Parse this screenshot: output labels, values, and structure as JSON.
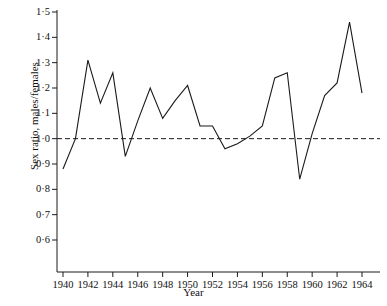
{
  "chart_data": {
    "type": "line",
    "title": "",
    "xlabel": "Year",
    "ylabel": "Sex ratio, males/females",
    "xlim": [
      1939.0,
      1965.0
    ],
    "ylim": [
      0.55,
      1.52
    ],
    "grid": false,
    "legend": null,
    "decimal_separator": "·",
    "y_ticks": [
      {
        "value": 1.5,
        "label": "1·5"
      },
      {
        "value": 1.4,
        "label": "1·4"
      },
      {
        "value": 1.3,
        "label": "1·3"
      },
      {
        "value": 1.2,
        "label": "1·2"
      },
      {
        "value": 1.1,
        "label": "1·1"
      },
      {
        "value": 1.0,
        "label": "1·0"
      },
      {
        "value": 0.9,
        "label": "0·9"
      },
      {
        "value": 0.8,
        "label": "0·8"
      },
      {
        "value": 0.7,
        "label": "0·7"
      },
      {
        "value": 0.6,
        "label": "0·6"
      }
    ],
    "x_ticks": [
      {
        "value": 1940,
        "label": "1940"
      },
      {
        "value": 1942,
        "label": "1942"
      },
      {
        "value": 1944,
        "label": "1944"
      },
      {
        "value": 1946,
        "label": "1946"
      },
      {
        "value": 1948,
        "label": "1948"
      },
      {
        "value": 1950,
        "label": "1950"
      },
      {
        "value": 1952,
        "label": "1952"
      },
      {
        "value": 1954,
        "label": "1954"
      },
      {
        "value": 1956,
        "label": "1956"
      },
      {
        "value": 1958,
        "label": "1958"
      },
      {
        "value": 1960,
        "label": "1960"
      },
      {
        "value": 1962,
        "label": "1962"
      },
      {
        "value": 1964,
        "label": "1964"
      }
    ],
    "x": [
      1940,
      1941,
      1942,
      1943,
      1944,
      1945,
      1946,
      1947,
      1948,
      1949,
      1950,
      1951,
      1952,
      1953,
      1954,
      1955,
      1956,
      1957,
      1958,
      1959,
      1960,
      1961,
      1962,
      1963,
      1964
    ],
    "values": [
      0.88,
      1.0,
      1.31,
      1.14,
      1.26,
      0.93,
      1.07,
      1.2,
      1.08,
      1.15,
      1.21,
      1.05,
      1.05,
      0.96,
      0.98,
      1.01,
      1.05,
      1.24,
      1.26,
      0.84,
      1.02,
      1.17,
      1.22,
      1.46,
      1.18
    ],
    "series": [
      {
        "name": "Sex ratio, males/females",
        "color": "#1a1a1a",
        "values": [
          0.88,
          1.0,
          1.31,
          1.14,
          1.26,
          0.93,
          1.07,
          1.2,
          1.08,
          1.15,
          1.21,
          1.05,
          1.05,
          0.96,
          0.98,
          1.01,
          1.05,
          1.24,
          1.26,
          0.84,
          1.02,
          1.17,
          1.22,
          1.46,
          1.18
        ]
      }
    ],
    "reference_line": {
      "name": "parity-line",
      "value": 1.0,
      "style": "dashed",
      "color": "#1a1a1a"
    },
    "axis_color": "#1a1a1a"
  }
}
